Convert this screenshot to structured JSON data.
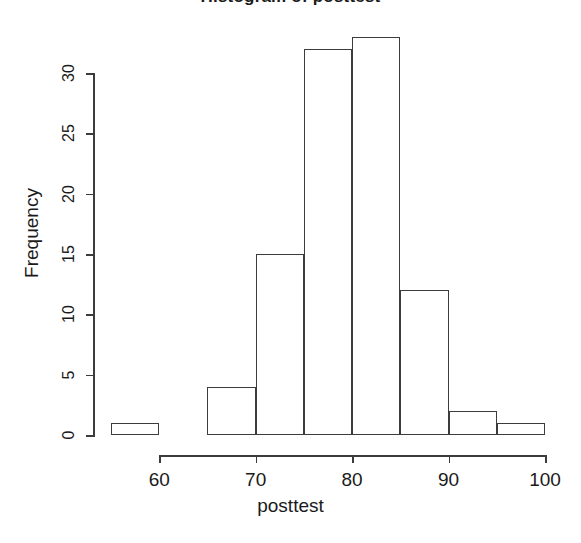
{
  "chart_data": {
    "type": "bar",
    "title": "Histogram of posttest",
    "xlabel": "posttest",
    "ylabel": "Frequency",
    "categories": [
      "55-60",
      "60-65",
      "65-70",
      "70-75",
      "75-80",
      "80-85",
      "85-90",
      "90-95",
      "95-100"
    ],
    "bin_starts": [
      55,
      60,
      65,
      70,
      75,
      80,
      85,
      90,
      95
    ],
    "bin_ends": [
      60,
      65,
      70,
      75,
      80,
      85,
      90,
      95,
      100
    ],
    "bin_width": 5,
    "values": [
      1,
      0,
      4,
      15,
      32,
      33,
      12,
      2,
      1
    ],
    "xlim": [
      55,
      100
    ],
    "ylim": [
      0,
      33
    ],
    "x_ticks": [
      60,
      70,
      80,
      90,
      100
    ],
    "x_tick_labels": [
      "60",
      "70",
      "80",
      "90",
      "100"
    ],
    "y_ticks": [
      0,
      5,
      10,
      15,
      20,
      25,
      30
    ],
    "y_tick_labels": [
      "0",
      "5",
      "10",
      "15",
      "20",
      "25",
      "30"
    ],
    "grid": false,
    "legend": false,
    "bar_fill": "#ffffff",
    "bar_stroke": "#3c3c3c",
    "background": "#ffffff",
    "total_count": 100
  }
}
